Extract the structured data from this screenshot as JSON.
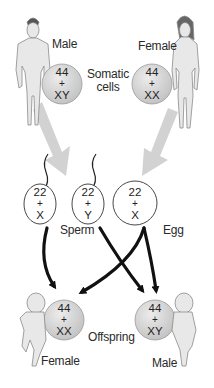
{
  "diagram": {
    "colors": {
      "somatic_circle_fill": "#d6d6d6",
      "gamete_circle_fill": "#ffffff",
      "gray_arrow": "#cfcfcf",
      "black_arrow": "#111111",
      "figure_fill": "#e6e6e6",
      "figure_stroke": "#8a8a8a"
    },
    "parents": {
      "male": {
        "label": "Male",
        "autosomes": "44",
        "plus": "+",
        "sex": "XY"
      },
      "female": {
        "label": "Female",
        "autosomes": "44",
        "plus": "+",
        "sex": "XX"
      },
      "caption": [
        "Somatic",
        "cells"
      ]
    },
    "gametes": {
      "sperm": [
        {
          "autosomes": "22",
          "plus": "+",
          "sex": "X"
        },
        {
          "autosomes": "22",
          "plus": "+",
          "sex": "Y"
        }
      ],
      "egg": {
        "autosomes": "22",
        "plus": "+",
        "sex": "X"
      },
      "sperm_label": "Sperm",
      "egg_label": "Egg"
    },
    "offspring": {
      "female": {
        "label": "Female",
        "autosomes": "44",
        "plus": "+",
        "sex": "XX"
      },
      "male": {
        "label": "Male",
        "autosomes": "44",
        "plus": "+",
        "sex": "XY"
      },
      "caption": "Offspring"
    }
  }
}
